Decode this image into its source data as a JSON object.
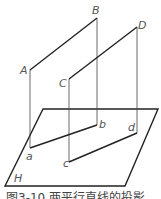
{
  "diagram": {
    "plane_label": "H",
    "points": {
      "A": "A",
      "B": "B",
      "C": "C",
      "D": "D",
      "a": "a",
      "b": "b",
      "c": "c",
      "d": "d"
    },
    "caption": "图3-10  两平行直线的投影"
  }
}
